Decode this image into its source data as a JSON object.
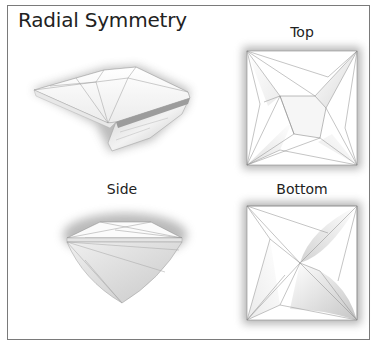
{
  "title": "Radial Symmetry",
  "views": {
    "perspective": {
      "label": ""
    },
    "top": {
      "label": "Top"
    },
    "side": {
      "label": "Side"
    },
    "bottom": {
      "label": "Bottom"
    }
  },
  "colors": {
    "border": "#7a7a7a",
    "facet_line": "#8a8a8a",
    "text": "#222222",
    "shadow": "#6a6a6a"
  }
}
